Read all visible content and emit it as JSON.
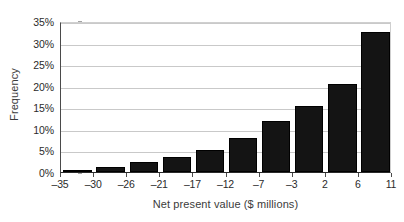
{
  "chart_data": {
    "type": "bar",
    "title": "",
    "subtitle": "",
    "xlabel": "Net present value ($ millions)",
    "ylabel": "Frequency",
    "categories": [
      "-35 to -30",
      "-30 to -26",
      "-26 to -21",
      "-21 to -17",
      "-17 to -12",
      "-12 to -7",
      "-7 to -3",
      "-3 to 2",
      "2 to 6",
      "6 to 11"
    ],
    "values": [
      0.3,
      1.2,
      2.3,
      3.5,
      5.1,
      7.9,
      11.9,
      15.3,
      20.5,
      32.5
    ],
    "bin_edges": [
      -35,
      -30,
      -26,
      -21,
      -17,
      -12,
      -7,
      -3,
      2,
      6,
      11
    ],
    "x_tick_labels": [
      "–35",
      "–30",
      "–26",
      "–21",
      "–17",
      "–12",
      "–7",
      "–3",
      "2",
      "6",
      "11"
    ],
    "y_tick_labels": [
      "0%",
      "5%",
      "10%",
      "15%",
      "20%",
      "25%",
      "30%",
      "35%"
    ],
    "y_tick_values": [
      0,
      5,
      10,
      15,
      20,
      25,
      30,
      35
    ],
    "ylim": [
      0,
      35
    ],
    "xlim": [
      -35,
      11
    ],
    "grid": true,
    "legend": "none",
    "bar_color": "#141414",
    "grid_color": "#c9c9c9",
    "axis_color": "#2a2a2a",
    "background": "#ffffff"
  }
}
